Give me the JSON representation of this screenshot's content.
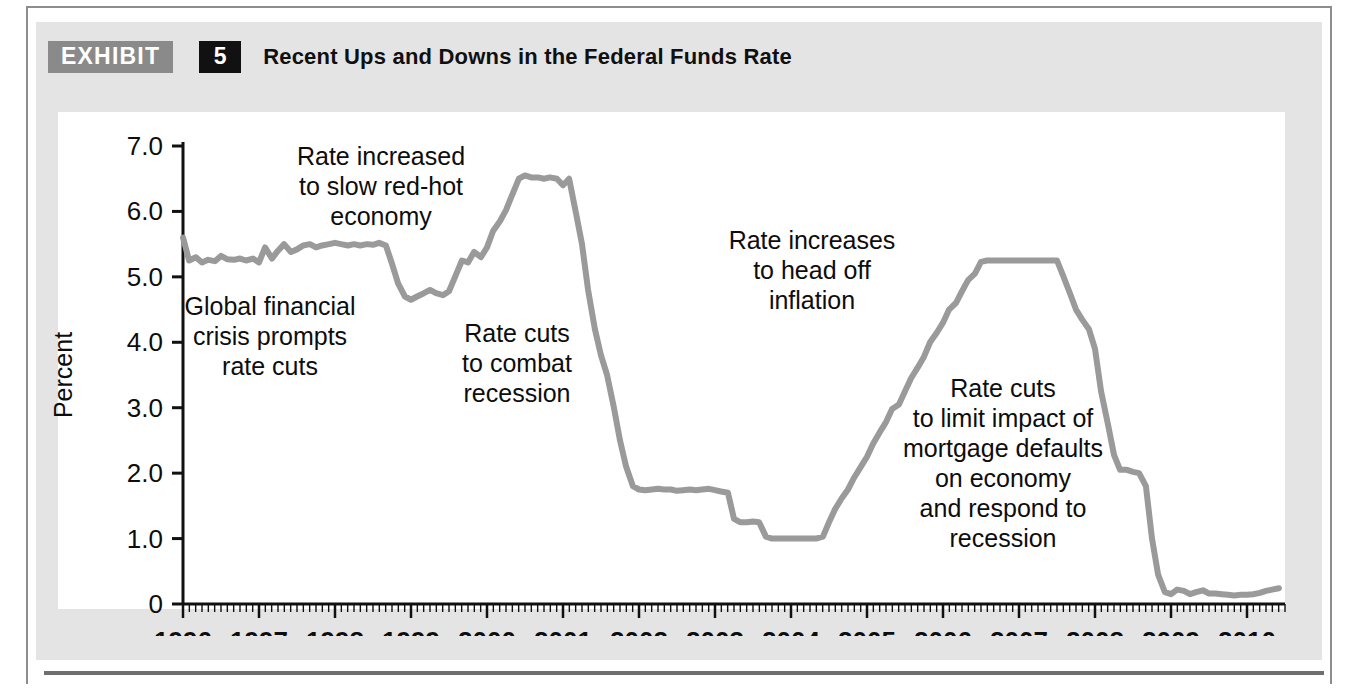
{
  "exhibit": {
    "badge_label": "EXHIBIT",
    "number": "5",
    "title": "Recent Ups and Downs in the Federal Funds Rate"
  },
  "caption": "",
  "colors": {
    "line": "#9a9a9a",
    "axis": "#111111",
    "panel": "#e4e4e4",
    "plot_bg": "#ffffff",
    "badge_gray": "#8a8a8a",
    "badge_black": "#111111"
  },
  "chart_data": {
    "type": "line",
    "title": "Recent Ups and Downs in the Federal Funds Rate",
    "xlabel": "",
    "ylabel": "Percent",
    "xlim": [
      1996.0,
      2010.5
    ],
    "ylim": [
      0,
      7.3
    ],
    "yticks": [
      0,
      1.0,
      2.0,
      3.0,
      4.0,
      5.0,
      6.0,
      7.0
    ],
    "ytick_labels": [
      "0",
      "1.0",
      "2.0",
      "3.0",
      "4.0",
      "5.0",
      "6.0",
      "7.0"
    ],
    "xticks": [
      1996,
      1997,
      1998,
      1999,
      2000,
      2001,
      2002,
      2003,
      2004,
      2005,
      2006,
      2007,
      2008,
      2009,
      2010
    ],
    "xtick_labels": [
      "1996",
      "1997",
      "1998",
      "1999",
      "2000",
      "2001",
      "2002",
      "2003",
      "2004",
      "2005",
      "2006",
      "2007",
      "2008",
      "2009",
      "2010"
    ],
    "minor_ticks_per_year": 12,
    "grid": false,
    "legend": false,
    "series": [
      {
        "name": "Federal funds rate",
        "color": "#9a9a9a",
        "x": [
          1996.0,
          1996.08,
          1996.17,
          1996.25,
          1996.33,
          1996.42,
          1996.5,
          1996.58,
          1996.67,
          1996.75,
          1996.83,
          1996.92,
          1997.0,
          1997.08,
          1997.17,
          1997.25,
          1997.33,
          1997.42,
          1997.5,
          1997.58,
          1997.67,
          1997.75,
          1997.83,
          1997.92,
          1998.0,
          1998.08,
          1998.17,
          1998.25,
          1998.33,
          1998.42,
          1998.5,
          1998.58,
          1998.67,
          1998.75,
          1998.83,
          1998.92,
          1999.0,
          1999.08,
          1999.17,
          1999.25,
          1999.33,
          1999.42,
          1999.5,
          1999.58,
          1999.67,
          1999.75,
          1999.83,
          1999.92,
          2000.0,
          2000.08,
          2000.17,
          2000.25,
          2000.33,
          2000.42,
          2000.5,
          2000.58,
          2000.67,
          2000.75,
          2000.83,
          2000.92,
          2001.0,
          2001.08,
          2001.17,
          2001.25,
          2001.33,
          2001.42,
          2001.5,
          2001.58,
          2001.67,
          2001.75,
          2001.83,
          2001.92,
          2002.0,
          2002.08,
          2002.17,
          2002.25,
          2002.33,
          2002.42,
          2002.5,
          2002.58,
          2002.67,
          2002.75,
          2002.83,
          2002.92,
          2003.0,
          2003.08,
          2003.17,
          2003.25,
          2003.33,
          2003.42,
          2003.5,
          2003.58,
          2003.67,
          2003.75,
          2003.83,
          2003.92,
          2004.0,
          2004.08,
          2004.17,
          2004.25,
          2004.33,
          2004.42,
          2004.5,
          2004.58,
          2004.67,
          2004.75,
          2004.83,
          2004.92,
          2005.0,
          2005.08,
          2005.17,
          2005.25,
          2005.33,
          2005.42,
          2005.5,
          2005.58,
          2005.67,
          2005.75,
          2005.83,
          2005.92,
          2006.0,
          2006.08,
          2006.17,
          2006.25,
          2006.33,
          2006.42,
          2006.5,
          2006.58,
          2006.67,
          2006.75,
          2006.83,
          2006.92,
          2007.0,
          2007.08,
          2007.17,
          2007.25,
          2007.33,
          2007.42,
          2007.5,
          2007.58,
          2007.67,
          2007.75,
          2007.83,
          2007.92,
          2008.0,
          2008.08,
          2008.17,
          2008.25,
          2008.33,
          2008.42,
          2008.5,
          2008.58,
          2008.67,
          2008.75,
          2008.83,
          2008.92,
          2009.0,
          2009.08,
          2009.17,
          2009.25,
          2009.33,
          2009.42,
          2009.5,
          2009.58,
          2009.67,
          2009.75,
          2009.83,
          2009.92,
          2010.0,
          2010.08,
          2010.17,
          2010.25,
          2010.33,
          2010.42
        ],
        "y": [
          5.6,
          5.25,
          5.3,
          5.22,
          5.26,
          5.24,
          5.32,
          5.27,
          5.26,
          5.28,
          5.25,
          5.28,
          5.22,
          5.45,
          5.28,
          5.4,
          5.5,
          5.38,
          5.42,
          5.48,
          5.5,
          5.45,
          5.48,
          5.5,
          5.52,
          5.5,
          5.48,
          5.5,
          5.48,
          5.5,
          5.49,
          5.52,
          5.48,
          5.2,
          4.9,
          4.7,
          4.65,
          4.7,
          4.75,
          4.8,
          4.75,
          4.72,
          4.78,
          5.0,
          5.25,
          5.22,
          5.38,
          5.3,
          5.45,
          5.7,
          5.85,
          6.02,
          6.25,
          6.5,
          6.55,
          6.52,
          6.52,
          6.5,
          6.52,
          6.5,
          6.4,
          6.5,
          5.98,
          5.5,
          4.8,
          4.2,
          3.8,
          3.5,
          3.0,
          2.5,
          2.1,
          1.8,
          1.75,
          1.74,
          1.75,
          1.76,
          1.75,
          1.75,
          1.73,
          1.74,
          1.75,
          1.74,
          1.75,
          1.76,
          1.74,
          1.72,
          1.7,
          1.3,
          1.25,
          1.25,
          1.26,
          1.25,
          1.03,
          1.0,
          1.0,
          1.0,
          1.0,
          1.0,
          1.0,
          1.0,
          1.0,
          1.03,
          1.25,
          1.45,
          1.62,
          1.75,
          1.93,
          2.1,
          2.25,
          2.45,
          2.63,
          2.78,
          2.98,
          3.05,
          3.25,
          3.45,
          3.62,
          3.78,
          4.0,
          4.15,
          4.3,
          4.5,
          4.6,
          4.78,
          4.95,
          5.05,
          5.23,
          5.25,
          5.25,
          5.25,
          5.25,
          5.25,
          5.25,
          5.25,
          5.25,
          5.25,
          5.25,
          5.25,
          5.25,
          5.02,
          4.75,
          4.5,
          4.35,
          4.2,
          3.9,
          3.25,
          2.75,
          2.28,
          2.05,
          2.05,
          2.02,
          2.0,
          1.8,
          1.0,
          0.45,
          0.18,
          0.15,
          0.22,
          0.2,
          0.15,
          0.18,
          0.21,
          0.16,
          0.16,
          0.15,
          0.14,
          0.13,
          0.14,
          0.14,
          0.15,
          0.17,
          0.2,
          0.22,
          0.24
        ]
      }
    ],
    "annotations": [
      {
        "name": "annotation-rate-increased",
        "lines": [
          "Rate increased",
          "to slow red-hot",
          "economy"
        ],
        "x_px": 381,
        "y_px": 165
      },
      {
        "name": "annotation-global-financial-crisis",
        "lines": [
          "Global financial",
          "crisis prompts",
          "rate cuts"
        ],
        "x_px": 270,
        "y_px": 315
      },
      {
        "name": "annotation-rate-cuts-recession",
        "lines": [
          "Rate cuts",
          "to combat",
          "recession"
        ],
        "x_px": 517,
        "y_px": 342
      },
      {
        "name": "annotation-rate-increases-inflation",
        "lines": [
          "Rate increases",
          "to head off",
          "inflation"
        ],
        "x_px": 812,
        "y_px": 249
      },
      {
        "name": "annotation-rate-cuts-mortgage",
        "lines": [
          "Rate cuts",
          "to limit impact of",
          "mortgage defaults",
          "on economy",
          "and respond to",
          "recession"
        ],
        "x_px": 1003,
        "y_px": 397
      }
    ]
  }
}
